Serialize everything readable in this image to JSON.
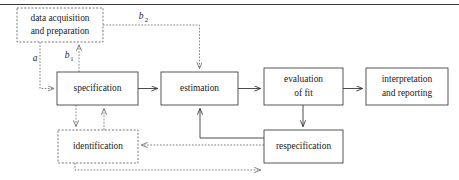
{
  "figure": {
    "top_rule": true,
    "colors": {
      "solid_stroke": "#3a3a3a",
      "dashed_stroke": "#777777",
      "box_fill": "#ffffff",
      "text": "#1a1a1a"
    }
  },
  "nodes": [
    {
      "id": "data-acquisition",
      "lines": [
        "data acquisition",
        "and preparation"
      ],
      "style": "dashed",
      "x": 17,
      "y": 8,
      "w": 86,
      "h": 34
    },
    {
      "id": "specification",
      "lines": [
        "specification"
      ],
      "style": "solid",
      "x": 57,
      "y": 72,
      "w": 81,
      "h": 33
    },
    {
      "id": "estimation",
      "lines": [
        "estimation"
      ],
      "style": "solid",
      "x": 161,
      "y": 72,
      "w": 77,
      "h": 33
    },
    {
      "id": "evaluation-of-fit",
      "lines": [
        "evaluation",
        "of fit"
      ],
      "style": "solid",
      "x": 264,
      "y": 68,
      "w": 79,
      "h": 37
    },
    {
      "id": "interpretation-and-reporting",
      "lines": [
        "interpretation",
        "and reporting"
      ],
      "style": "solid",
      "x": 366,
      "y": 68,
      "w": 82,
      "h": 37
    },
    {
      "id": "identification",
      "lines": [
        "identification"
      ],
      "style": "dashed",
      "x": 58,
      "y": 130,
      "w": 80,
      "h": 33
    },
    {
      "id": "respecification",
      "lines": [
        "respecification"
      ],
      "style": "solid",
      "x": 264,
      "y": 130,
      "w": 79,
      "h": 33
    }
  ],
  "edges": [
    {
      "id": "data-acq-to-specification",
      "label": "a",
      "sub": "",
      "style": "dotted"
    },
    {
      "id": "specification-to-data-acq",
      "label": "b",
      "sub": "1",
      "style": "dotted"
    },
    {
      "id": "data-acq-to-estimation",
      "label": "b",
      "sub": "2",
      "style": "dotted"
    },
    {
      "id": "specification-to-estimation",
      "label": "",
      "sub": "",
      "style": "solid"
    },
    {
      "id": "estimation-to-evaluation",
      "label": "",
      "sub": "",
      "style": "solid"
    },
    {
      "id": "evaluation-to-interpretation",
      "label": "",
      "sub": "",
      "style": "solid"
    },
    {
      "id": "specification-to-identification",
      "label": "",
      "sub": "",
      "style": "dotted"
    },
    {
      "id": "identification-to-specification",
      "label": "",
      "sub": "",
      "style": "dotted"
    },
    {
      "id": "evaluation-to-respecification",
      "label": "",
      "sub": "",
      "style": "solid"
    },
    {
      "id": "respecification-to-estimation",
      "label": "",
      "sub": "",
      "style": "solid"
    },
    {
      "id": "respecification-to-identification",
      "label": "",
      "sub": "",
      "style": "dotted"
    },
    {
      "id": "identification-to-respecification",
      "label": "",
      "sub": "",
      "style": "dotted"
    }
  ],
  "labels": {
    "a": "a",
    "b1_base": "b",
    "b1_sub": "1",
    "b2_base": "b",
    "b2_sub": "2"
  }
}
